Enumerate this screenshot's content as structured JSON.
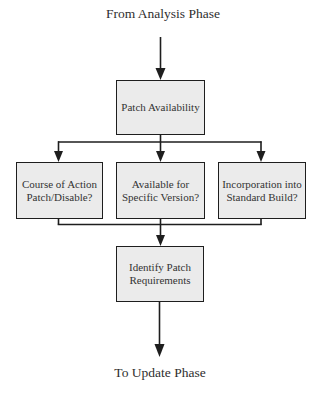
{
  "diagram": {
    "title_top": "From Analysis Phase",
    "title_bottom": "To Update Phase",
    "nodes": {
      "patch_availability": {
        "line1": "Patch Availability"
      },
      "course_of_action": {
        "line1": "Course of Action",
        "line2": "Patch/Disable?"
      },
      "available_for_version": {
        "line1": "Available for",
        "line2": "Specific Version?"
      },
      "incorporation_build": {
        "line1": "Incorporation into",
        "line2": "Standard Build?"
      },
      "identify_requirements": {
        "line1": "Identify Patch",
        "line2": "Requirements"
      }
    },
    "edges": [
      {
        "from": "From Analysis Phase",
        "to": "Patch Availability"
      },
      {
        "from": "Patch Availability",
        "to": "Course of Action Patch/Disable?"
      },
      {
        "from": "Patch Availability",
        "to": "Available for Specific Version?"
      },
      {
        "from": "Patch Availability",
        "to": "Incorporation into Standard Build?"
      },
      {
        "from": "Course of Action Patch/Disable?",
        "to": "Identify Patch Requirements"
      },
      {
        "from": "Available for Specific Version?",
        "to": "Identify Patch Requirements"
      },
      {
        "from": "Incorporation into Standard Build?",
        "to": "Identify Patch Requirements"
      },
      {
        "from": "Identify Patch Requirements",
        "to": "To Update Phase"
      }
    ],
    "colors": {
      "box_fill": "#ebebeb",
      "stroke": "#1e1e1e",
      "text": "#2e2e2e"
    }
  }
}
